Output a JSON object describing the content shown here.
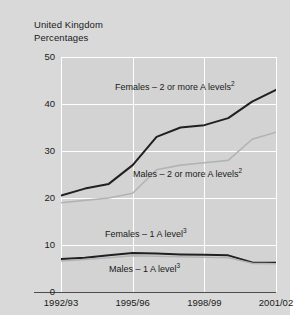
{
  "header": {
    "country": "United Kingdom",
    "units": "Percentages"
  },
  "annotations": [
    {
      "id": "females-2plus",
      "text": "Females – 2 or more A levels",
      "sup": "2",
      "x": 110,
      "y": 75
    },
    {
      "id": "males-2plus",
      "text": "Males – 2 or more A levels",
      "sup": "2",
      "x": 128,
      "y": 162
    },
    {
      "id": "females-1",
      "text": "Females – 1 A level",
      "sup": "3",
      "x": 100,
      "y": 222
    },
    {
      "id": "males-1",
      "text": "Males – 1 A level",
      "sup": "3",
      "x": 104,
      "y": 257
    }
  ],
  "colors": {
    "dark_line": "#231f20",
    "light_line": "#b3b3b3",
    "plot_background": "#d3d3d3",
    "page_background": "#d9d9d9",
    "gridline": "#ffffff",
    "axis": "#4d4d4d",
    "text": "#1a1a1a"
  },
  "chart_data": {
    "type": "line",
    "title": "",
    "subtitle": "",
    "xlabel": "",
    "ylabel": "Percentages",
    "ylim": [
      0,
      50
    ],
    "yticks": [
      0,
      10,
      20,
      30,
      40,
      50
    ],
    "xticks": [
      "1992/93",
      "1995/96",
      "1998/99",
      "2001/02"
    ],
    "x": [
      "1992/93",
      "1993/94",
      "1994/95",
      "1995/96",
      "1996/97",
      "1997/98",
      "1998/99",
      "1999/00",
      "2000/01",
      "2001/02"
    ],
    "grid": true,
    "legend": "inline-annotations",
    "series": [
      {
        "name": "Females – 2 or more A levels",
        "footnote": "2",
        "color": "#231f20",
        "values": [
          20.5,
          22,
          23,
          27,
          33,
          35,
          35.5,
          37,
          40.5,
          43
        ]
      },
      {
        "name": "Males – 2 or more A levels",
        "footnote": "2",
        "color": "#b3b3b3",
        "values": [
          19,
          19.5,
          20,
          21,
          26,
          27,
          27.5,
          28,
          32.5,
          34
        ]
      },
      {
        "name": "Females – 1 A level",
        "footnote": "3",
        "color": "#231f20",
        "values": [
          7,
          7.3,
          7.8,
          8.3,
          8.2,
          8,
          7.9,
          7.8,
          6.3,
          6.2
        ]
      },
      {
        "name": "Males – 1 A level",
        "footnote": "3",
        "color": "#b3b3b3",
        "values": [
          6.6,
          6.9,
          7.3,
          7.7,
          7.6,
          7.5,
          7.4,
          7.3,
          6.1,
          6.0
        ]
      }
    ]
  }
}
